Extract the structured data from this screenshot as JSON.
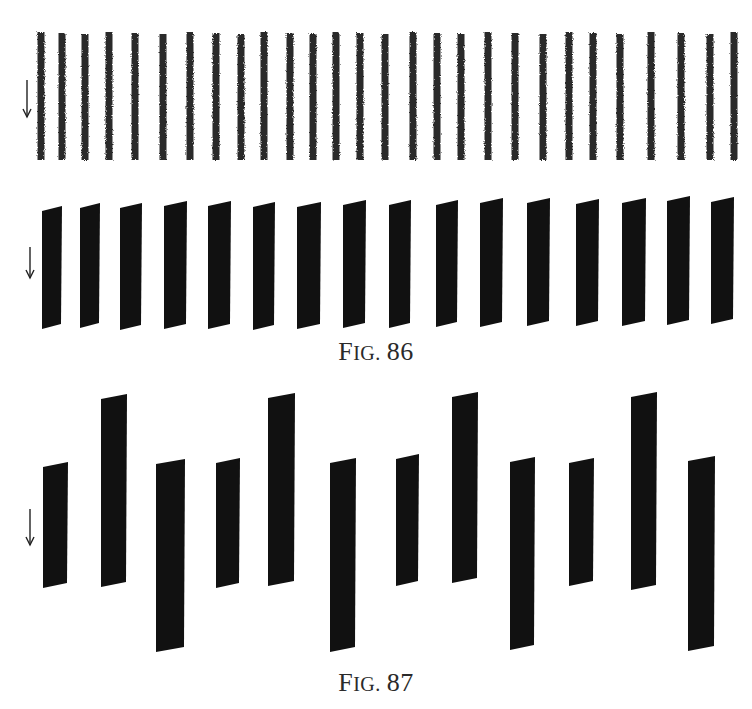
{
  "page": {
    "background": "#ffffff",
    "ink_color": "#111111"
  },
  "figures": [
    {
      "id": "fig-86",
      "caption": {
        "prefix_initial": "F",
        "prefix_rest": "IG.",
        "number": "86",
        "full": "FIG. 86"
      },
      "panels": [
        {
          "name": "thin-strokes-row",
          "style": "crayon",
          "arrow": {
            "direction": "down",
            "x": 27,
            "y1": 80,
            "y2": 117
          },
          "stroke_count": 28,
          "y_top": 33,
          "y_bottom": 160,
          "x_positions": [
            41,
            62,
            85,
            109,
            135,
            163,
            190,
            216,
            241,
            264,
            290,
            313,
            336,
            360,
            385,
            413,
            437,
            461,
            488,
            515,
            543,
            569,
            593,
            620,
            651,
            681,
            710,
            734
          ]
        },
        {
          "name": "thick-bars-row",
          "style": "solid",
          "arrow": {
            "direction": "down",
            "x": 30,
            "y1": 247,
            "y2": 278
          },
          "bar_count": 16,
          "bars": [
            {
              "x1": 42,
              "x2": 62,
              "top": 206,
              "bottom": 329
            },
            {
              "x1": 80,
              "x2": 100,
              "top": 203,
              "bottom": 328
            },
            {
              "x1": 120,
              "x2": 142,
              "top": 203,
              "bottom": 330
            },
            {
              "x1": 164,
              "x2": 187,
              "top": 201,
              "bottom": 329
            },
            {
              "x1": 208,
              "x2": 231,
              "top": 201,
              "bottom": 329
            },
            {
              "x1": 253,
              "x2": 275,
              "top": 202,
              "bottom": 330
            },
            {
              "x1": 297,
              "x2": 321,
              "top": 202,
              "bottom": 329
            },
            {
              "x1": 343,
              "x2": 366,
              "top": 200,
              "bottom": 328
            },
            {
              "x1": 389,
              "x2": 411,
              "top": 200,
              "bottom": 328
            },
            {
              "x1": 436,
              "x2": 458,
              "top": 200,
              "bottom": 327
            },
            {
              "x1": 480,
              "x2": 503,
              "top": 198,
              "bottom": 327
            },
            {
              "x1": 527,
              "x2": 550,
              "top": 198,
              "bottom": 326
            },
            {
              "x1": 576,
              "x2": 599,
              "top": 199,
              "bottom": 326
            },
            {
              "x1": 622,
              "x2": 646,
              "top": 198,
              "bottom": 326
            },
            {
              "x1": 667,
              "x2": 690,
              "top": 196,
              "bottom": 325
            },
            {
              "x1": 711,
              "x2": 734,
              "top": 197,
              "bottom": 324
            }
          ]
        }
      ]
    },
    {
      "id": "fig-87",
      "caption": {
        "prefix_initial": "F",
        "prefix_rest": "IG.",
        "number": "87",
        "full": "FIG. 87"
      },
      "panels": [
        {
          "name": "varied-bars-row",
          "style": "solid",
          "arrow": {
            "direction": "down",
            "x": 30,
            "y1": 509,
            "y2": 545
          },
          "bar_count": 12,
          "pattern": [
            "short",
            "tall-up",
            "long-down",
            "short",
            "tall-up",
            "long-down",
            "short",
            "tall-up",
            "long-down",
            "short",
            "tall-up",
            "long-down"
          ],
          "bars": [
            {
              "x1": 43,
              "x2": 68,
              "top": 462,
              "bottom": 588
            },
            {
              "x1": 101,
              "x2": 127,
              "top": 394,
              "bottom": 587
            },
            {
              "x1": 156,
              "x2": 185,
              "top": 459,
              "bottom": 652
            },
            {
              "x1": 216,
              "x2": 240,
              "top": 458,
              "bottom": 588
            },
            {
              "x1": 268,
              "x2": 295,
              "top": 393,
              "bottom": 586
            },
            {
              "x1": 330,
              "x2": 356,
              "top": 458,
              "bottom": 652
            },
            {
              "x1": 396,
              "x2": 419,
              "top": 454,
              "bottom": 586
            },
            {
              "x1": 452,
              "x2": 478,
              "top": 392,
              "bottom": 583
            },
            {
              "x1": 510,
              "x2": 535,
              "top": 457,
              "bottom": 650
            },
            {
              "x1": 569,
              "x2": 594,
              "top": 458,
              "bottom": 586
            },
            {
              "x1": 631,
              "x2": 657,
              "top": 392,
              "bottom": 590
            },
            {
              "x1": 688,
              "x2": 715,
              "top": 456,
              "bottom": 651
            }
          ]
        }
      ]
    }
  ]
}
